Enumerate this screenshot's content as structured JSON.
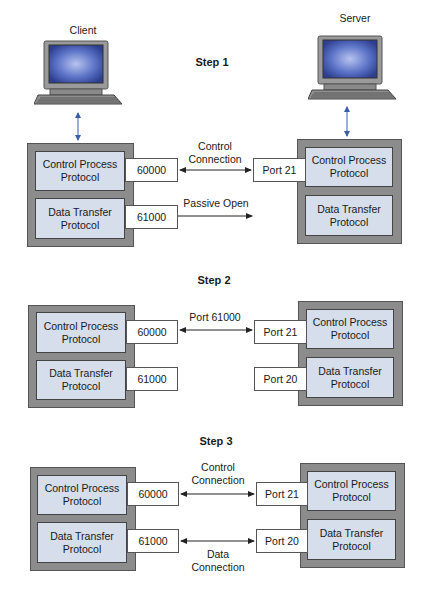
{
  "labels": {
    "client": "Client",
    "server": "Server"
  },
  "steps": [
    {
      "title": "Step 1",
      "client": {
        "control_process": "Control Process\nProtocol",
        "data_transfer": "Data Transfer\nProtocol",
        "control_port": "60000",
        "data_port": "61000"
      },
      "server": {
        "control_process": "Control Process\nProtocol",
        "data_transfer": "Data Transfer\nProtocol",
        "control_port": "Port 21"
      },
      "connections": {
        "control_label": "Control\nConnection",
        "data_label": "Passive Open"
      }
    },
    {
      "title": "Step 2",
      "client": {
        "control_process": "Control Process\nProtocol",
        "data_transfer": "Data Transfer\nProtocol",
        "control_port": "60000",
        "data_port": "61000"
      },
      "server": {
        "control_process": "Control Process\nProtocol",
        "data_transfer": "Data Transfer\nProtocol",
        "control_port": "Port 21",
        "data_port": "Port 20"
      },
      "connections": {
        "control_label": "Port 61000"
      }
    },
    {
      "title": "Step 3",
      "client": {
        "control_process": "Control Process\nProtocol",
        "data_transfer": "Data Transfer\nProtocol",
        "control_port": "60000",
        "data_port": "61000"
      },
      "server": {
        "control_process": "Control Process\nProtocol",
        "data_transfer": "Data Transfer\nProtocol",
        "control_port": "Port 21",
        "data_port": "Port 20"
      },
      "connections": {
        "control_label": "Control\nConnection",
        "data_label": "Data\nConnection"
      }
    }
  ],
  "colors": {
    "outer_box": "#8c8c8c",
    "inner_box": "#d5deea",
    "port_box": "#ffffff",
    "computer_link": "#3a5ea8",
    "screen": "#4a63b8"
  }
}
